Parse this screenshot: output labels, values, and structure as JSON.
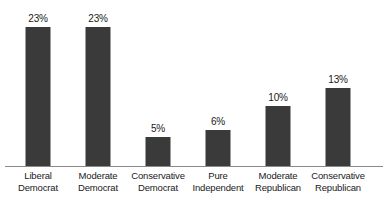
{
  "chart_data": {
    "type": "bar",
    "title": "",
    "xlabel": "",
    "ylabel": "",
    "ylim": [
      0,
      25
    ],
    "grid": false,
    "legend": false,
    "value_label_suffix": "%",
    "categories": [
      "Liberal Democrat",
      "Moderate Democrat",
      "Conservative Democrat",
      "Pure Independent",
      "Moderate Republican",
      "Conservative Republican"
    ],
    "values": [
      23,
      23,
      5,
      6,
      10,
      13
    ],
    "bars": [
      {
        "label_line1": "Liberal",
        "label_line2": "Democrat",
        "value": 23,
        "value_label": "23%"
      },
      {
        "label_line1": "Moderate",
        "label_line2": "Democrat",
        "value": 23,
        "value_label": "23%"
      },
      {
        "label_line1": "Conservative",
        "label_line2": "Democrat",
        "value": 5,
        "value_label": "5%"
      },
      {
        "label_line1": "Pure",
        "label_line2": "Independent",
        "value": 6,
        "value_label": "6%"
      },
      {
        "label_line1": "Moderate",
        "label_line2": "Republican",
        "value": 10,
        "value_label": "10%"
      },
      {
        "label_line1": "Conservative",
        "label_line2": "Republican",
        "value": 13,
        "value_label": "13%"
      }
    ],
    "colors": {
      "bar": "#3a3a3a",
      "axis": "#8a8a8a",
      "text": "#1a1a1a",
      "background": "#ffffff"
    }
  }
}
